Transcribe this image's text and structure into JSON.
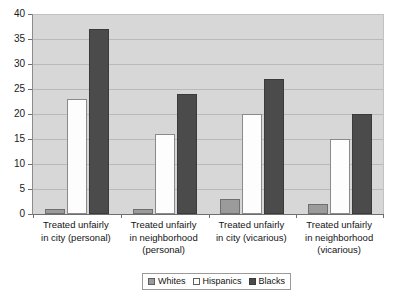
{
  "chart_data": {
    "type": "bar",
    "title": "",
    "subtitle": "",
    "xlabel": "",
    "ylabel": "",
    "ylim": [
      0,
      40
    ],
    "ytick_step": 5,
    "yticks": [
      0,
      5,
      10,
      15,
      20,
      25,
      30,
      35,
      40
    ],
    "grid": true,
    "legend_position": "bottom-center",
    "categories": [
      "Treated unfairly in city (personal)",
      "Treated unfairly in neighborhood (personal)",
      "Treated unfairly in city (vicarious)",
      "Treated unfairly in neighborhood (vicarious)"
    ],
    "category_lines": [
      [
        "Treated unfairly",
        "in city (personal)"
      ],
      [
        "Treated unfairly",
        "in neighborhood",
        "(personal)"
      ],
      [
        "Treated unfairly",
        "in city (vicarious)"
      ],
      [
        "Treated unfairly",
        "in neighborhood",
        "(vicarious)"
      ]
    ],
    "series": [
      {
        "name": "Whites",
        "color": "#9b9b9b",
        "values": [
          1,
          1,
          3,
          2
        ]
      },
      {
        "name": "Hispanics",
        "color": "#ffffff",
        "values": [
          23,
          16,
          20,
          15
        ]
      },
      {
        "name": "Blacks",
        "color": "#4b4b4b",
        "values": [
          37,
          24,
          27,
          20
        ]
      }
    ]
  },
  "colors": {
    "plot_background": "#d7d7d7",
    "gridline": "#b9b9b9",
    "axis": "#6e6e6e",
    "text": "#141414",
    "page_background": "#ffffff"
  }
}
